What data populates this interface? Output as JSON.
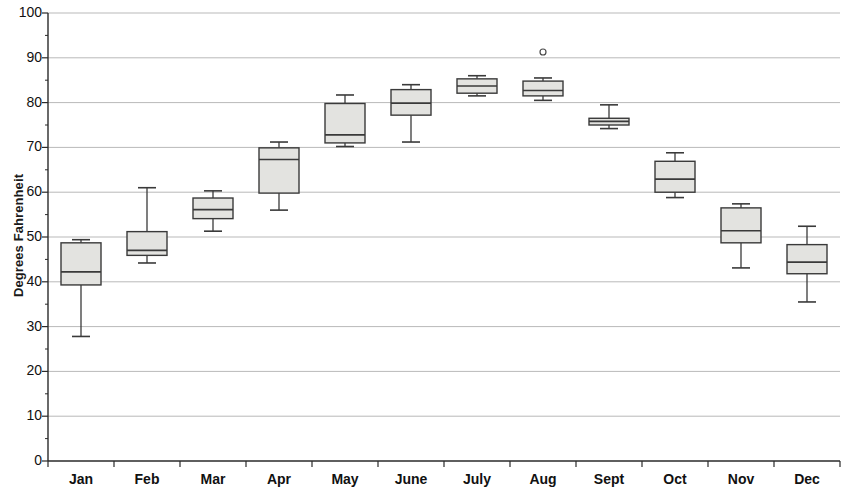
{
  "chart_data": {
    "type": "box",
    "title": "",
    "xlabel": "",
    "ylabel": "Degrees Fahrenheit",
    "ylim": [
      0,
      100
    ],
    "ytick_labels": [
      "0",
      "10",
      "20",
      "30",
      "40",
      "50",
      "60",
      "70",
      "80",
      "90",
      "100"
    ],
    "ytick_values": [
      0,
      10,
      20,
      30,
      40,
      50,
      60,
      70,
      80,
      90,
      100
    ],
    "grid": true,
    "grid_axis": "y",
    "legend": null,
    "categories": [
      "Jan",
      "Feb",
      "Mar",
      "Apr",
      "May",
      "June",
      "July",
      "Aug",
      "Sept",
      "Oct",
      "Nov",
      "Dec"
    ],
    "boxes": [
      {
        "category": "Jan",
        "min": 27.8,
        "q1": 39.3,
        "median": 42.2,
        "q3": 48.7,
        "max": 49.4,
        "outliers": []
      },
      {
        "category": "Feb",
        "min": 44.2,
        "q1": 45.9,
        "median": 47.0,
        "q3": 51.2,
        "max": 61.0,
        "outliers": []
      },
      {
        "category": "Mar",
        "min": 51.3,
        "q1": 54.1,
        "median": 56.1,
        "q3": 58.7,
        "max": 60.3,
        "outliers": []
      },
      {
        "category": "Apr",
        "min": 56.0,
        "q1": 59.8,
        "median": 67.3,
        "q3": 69.9,
        "max": 71.2,
        "outliers": []
      },
      {
        "category": "May",
        "min": 70.2,
        "q1": 71.0,
        "median": 72.8,
        "q3": 79.8,
        "max": 81.7,
        "outliers": []
      },
      {
        "category": "June",
        "min": 71.2,
        "q1": 77.2,
        "median": 79.9,
        "q3": 82.9,
        "max": 84.0,
        "outliers": []
      },
      {
        "category": "July",
        "min": 81.5,
        "q1": 82.1,
        "median": 83.7,
        "q3": 85.3,
        "max": 86.0,
        "outliers": []
      },
      {
        "category": "Aug",
        "min": 80.5,
        "q1": 81.5,
        "median": 82.7,
        "q3": 84.8,
        "max": 85.5,
        "outliers": [
          91.3
        ]
      },
      {
        "category": "Sept",
        "min": 74.2,
        "q1": 75.0,
        "median": 75.8,
        "q3": 76.5,
        "max": 79.5,
        "outliers": []
      },
      {
        "category": "Oct",
        "min": 58.8,
        "q1": 60.0,
        "median": 62.9,
        "q3": 66.9,
        "max": 68.8,
        "outliers": []
      },
      {
        "category": "Nov",
        "min": 43.1,
        "q1": 48.7,
        "median": 51.4,
        "q3": 56.5,
        "max": 57.4,
        "outliers": []
      },
      {
        "category": "Dec",
        "min": 35.5,
        "q1": 41.8,
        "median": 44.4,
        "q3": 48.3,
        "max": 52.4,
        "outliers": []
      }
    ],
    "colors": {
      "box_fill": "#e3e3e0",
      "box_stroke": "#3a3a3a",
      "whisker": "#3a3a3a",
      "grid": "#b9b9b9",
      "axis": "#2a2a2a",
      "outlier_stroke": "#4a4a4a"
    }
  }
}
